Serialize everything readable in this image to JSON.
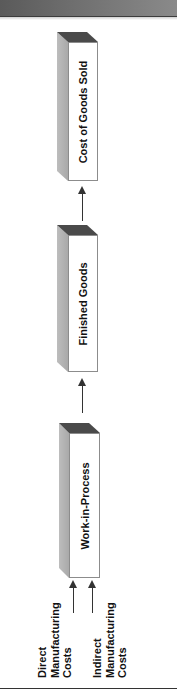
{
  "diagram": {
    "type": "flow",
    "orientation": "bottom-to-top (rotated 90° counter-clockwise)",
    "stages": [
      {
        "id": "cogs",
        "label": "Cost of Goods Sold"
      },
      {
        "id": "finished",
        "label": "Finished Goods"
      },
      {
        "id": "wip",
        "label": "Work-in-Process"
      }
    ],
    "inputs": [
      {
        "id": "direct",
        "lines": [
          "Direct",
          "Manufacturing",
          "Costs"
        ]
      },
      {
        "id": "indirect",
        "lines": [
          "Indirect",
          "Manufacturing",
          "Costs"
        ]
      }
    ],
    "flows": [
      {
        "from": "direct",
        "to": "wip"
      },
      {
        "from": "indirect",
        "to": "wip"
      },
      {
        "from": "wip",
        "to": "finished"
      },
      {
        "from": "finished",
        "to": "cogs"
      }
    ],
    "colors": {
      "top_face": "#4a4a4a",
      "side_face": "#b5b5b5",
      "front_face": "#ffffff",
      "arrow": "#333333",
      "header_bar": "#6e6e6e"
    }
  }
}
